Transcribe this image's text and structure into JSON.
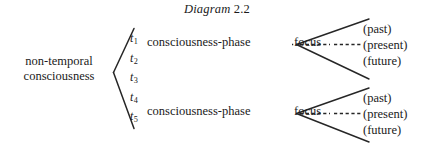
{
  "diagram": {
    "title": "Diagram 2.2",
    "title_word": "Diagram",
    "title_number": "2.2",
    "root_label_line1": "non-temporal",
    "root_label_line2": "consciousness",
    "time_points": [
      {
        "symbol": "t",
        "index": "1"
      },
      {
        "symbol": "t",
        "index": "2"
      },
      {
        "symbol": "t",
        "index": "3"
      },
      {
        "symbol": "t",
        "index": "4"
      },
      {
        "symbol": "t",
        "index": "5"
      }
    ],
    "branches": [
      {
        "phase_label": "consciousness-phase",
        "relation_label": "focus",
        "tenses": [
          "(past)",
          "(present)",
          "(future)"
        ]
      },
      {
        "phase_label": "consciousness-phase",
        "relation_label": "focus",
        "tenses": [
          "(past)",
          "(present)",
          "(future)"
        ]
      }
    ],
    "colors": {
      "ink": "#1a1a1a",
      "line": "#262626",
      "background": "#ffffff"
    }
  }
}
